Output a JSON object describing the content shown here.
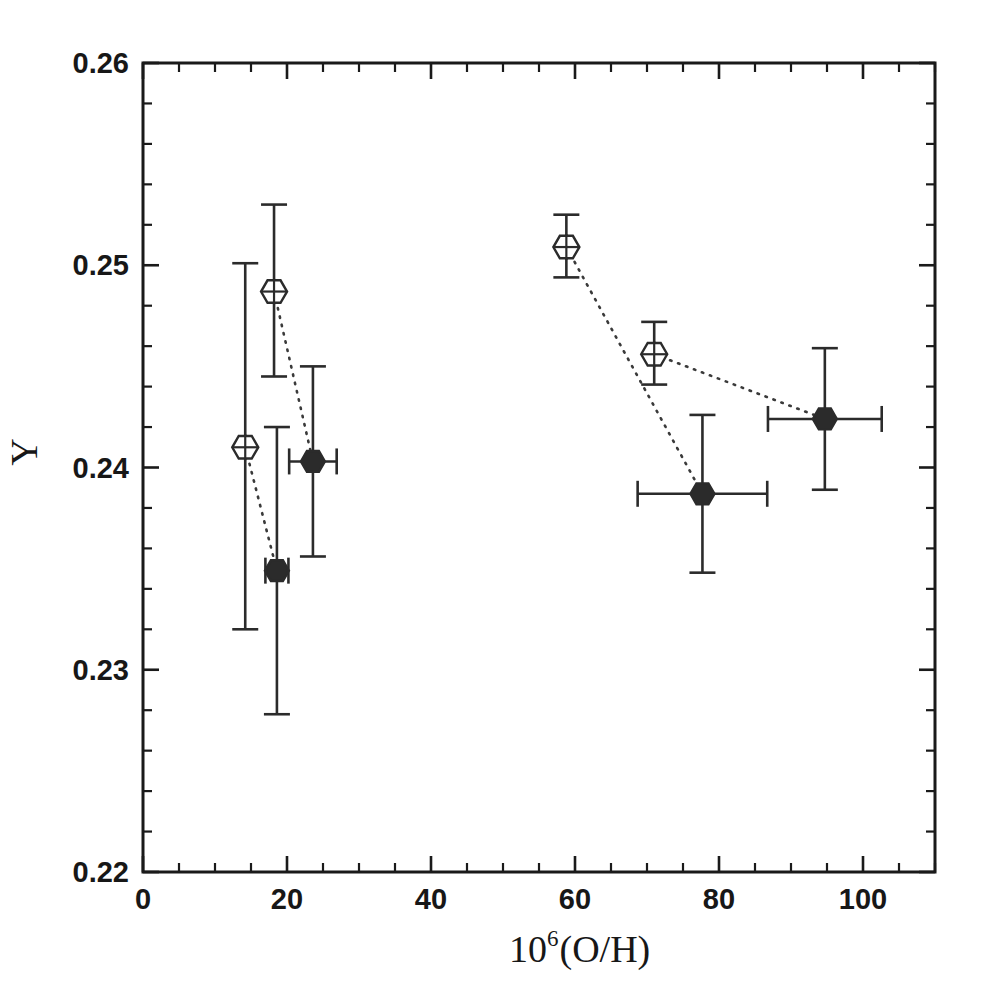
{
  "chart_data": {
    "type": "scatter",
    "title": "",
    "xlabel": "10^6(O/H)",
    "xlabel_base": "10",
    "xlabel_exp": "6",
    "xlabel_rest": "(O/H)",
    "ylabel": "Y",
    "xlim": [
      0,
      110
    ],
    "ylim": [
      0.22,
      0.26
    ],
    "x_major_ticks": [
      0,
      20,
      40,
      60,
      80,
      100
    ],
    "x_major_tick_labels": [
      "0",
      "20",
      "40",
      "60",
      "80",
      "100"
    ],
    "x_minor_interval": 5,
    "y_major_ticks": [
      0.22,
      0.23,
      0.24,
      0.25,
      0.26
    ],
    "y_major_tick_labels": [
      "0.22",
      "0.23",
      "0.24",
      "0.25",
      "0.26"
    ],
    "y_minor_interval": 0.002,
    "grid": false,
    "legend": "none",
    "colors": {
      "axis": "#1a1a1a",
      "marker_open_fill": "#ffffff",
      "marker_stroke": "#2b2b2b",
      "marker_filled_fill": "#2b2b2b",
      "connector": "#3a3a3a"
    },
    "series": [
      {
        "name": "open-hexagon",
        "marker": "open hexagon",
        "points": [
          {
            "x": 18.2,
            "y": 0.2487,
            "yerr_low": 0.0042,
            "yerr_high": 0.0043,
            "xerr_low": 0,
            "xerr_high": 0
          },
          {
            "x": 14.2,
            "y": 0.241,
            "yerr_low": 0.009,
            "yerr_high": 0.0091,
            "xerr_low": 0,
            "xerr_high": 0
          },
          {
            "x": 58.8,
            "y": 0.2509,
            "yerr_low": 0.0015,
            "yerr_high": 0.0016,
            "xerr_low": 0,
            "xerr_high": 0
          },
          {
            "x": 71.0,
            "y": 0.2456,
            "yerr_low": 0.0015,
            "yerr_high": 0.0016,
            "xerr_low": 0,
            "xerr_high": 0
          }
        ]
      },
      {
        "name": "filled-circle",
        "marker": "filled circle",
        "points": [
          {
            "x": 18.6,
            "y": 0.2349,
            "yerr_low": 0.0071,
            "yerr_high": 0.0071,
            "xerr_low": 1.6,
            "xerr_high": 1.6
          },
          {
            "x": 23.6,
            "y": 0.2403,
            "yerr_low": 0.0047,
            "yerr_high": 0.0047,
            "xerr_low": 3.3,
            "xerr_high": 3.3
          },
          {
            "x": 77.7,
            "y": 0.2387,
            "yerr_low": 0.0039,
            "yerr_high": 0.0039,
            "xerr_low": 9.0,
            "xerr_high": 9.0
          },
          {
            "x": 94.7,
            "y": 0.2424,
            "yerr_low": 0.0035,
            "yerr_high": 0.0035,
            "xerr_low": 7.9,
            "xerr_high": 7.9
          }
        ]
      }
    ],
    "connectors": [
      {
        "from": {
          "x": 18.2,
          "y": 0.2487
        },
        "to": {
          "x": 23.6,
          "y": 0.2403
        }
      },
      {
        "from": {
          "x": 14.2,
          "y": 0.241
        },
        "to": {
          "x": 18.6,
          "y": 0.2349
        }
      },
      {
        "from": {
          "x": 58.8,
          "y": 0.2509
        },
        "to": {
          "x": 77.7,
          "y": 0.2387
        }
      },
      {
        "from": {
          "x": 71.0,
          "y": 0.2456
        },
        "to": {
          "x": 94.7,
          "y": 0.2424
        }
      }
    ]
  }
}
